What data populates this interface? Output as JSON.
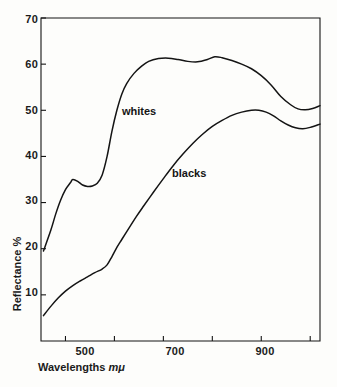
{
  "chart_data": {
    "type": "line",
    "title": "",
    "xlabel": "Wavelengths mμ",
    "xlabel_text": "Wavelengths",
    "xlabel_unit": "mμ",
    "ylabel": "Reflectance %",
    "xlim": [
      450,
      1020
    ],
    "ylim": [
      0,
      70
    ],
    "grid": false,
    "legend_position": "inline-annotations",
    "x_ticks_major": [
      500,
      700,
      900
    ],
    "x_tick_labels": [
      "500",
      "700",
      "900"
    ],
    "x_ticks_minor": [
      600,
      800,
      1000
    ],
    "y_ticks": [
      10,
      20,
      30,
      40,
      50,
      60,
      70
    ],
    "y_tick_labels": [
      "10",
      "20",
      "30",
      "40",
      "50",
      "60",
      "70"
    ],
    "line_color": "#141414",
    "background_color": "#fdfdfb",
    "series": [
      {
        "name": "whites",
        "label": "whites",
        "x": [
          455,
          470,
          480,
          490,
          500,
          510,
          515,
          525,
          535,
          545,
          555,
          565,
          575,
          585,
          595,
          605,
          615,
          625,
          640,
          655,
          670,
          690,
          710,
          730,
          750,
          770,
          790,
          805,
          820,
          840,
          860,
          880,
          900,
          920,
          940,
          960,
          975,
          990,
          1005,
          1020
        ],
        "y": [
          19.5,
          24.0,
          27.5,
          30.5,
          32.8,
          34.3,
          35.0,
          34.6,
          33.8,
          33.5,
          33.6,
          34.2,
          36.0,
          40.0,
          45.5,
          50.0,
          53.5,
          55.8,
          58.0,
          59.5,
          60.6,
          61.2,
          61.3,
          61.0,
          60.6,
          60.5,
          61.0,
          61.6,
          61.4,
          60.8,
          60.0,
          59.0,
          57.5,
          55.5,
          53.0,
          51.2,
          50.3,
          50.1,
          50.4,
          51.0
        ]
      },
      {
        "name": "blacks",
        "label": "blacks",
        "x": [
          455,
          470,
          485,
          500,
          515,
          530,
          545,
          560,
          575,
          585,
          595,
          605,
          615,
          630,
          645,
          660,
          680,
          700,
          720,
          740,
          760,
          780,
          800,
          820,
          840,
          860,
          880,
          895,
          910,
          925,
          940,
          955,
          970,
          985,
          1000,
          1020
        ],
        "y": [
          5.5,
          7.5,
          9.3,
          10.8,
          12.0,
          13.0,
          13.9,
          14.8,
          15.6,
          16.5,
          18.3,
          20.3,
          22.0,
          24.5,
          27.0,
          29.3,
          32.3,
          35.2,
          38.0,
          40.5,
          42.8,
          44.8,
          46.5,
          47.8,
          48.9,
          49.6,
          50.0,
          50.0,
          49.6,
          48.8,
          47.7,
          46.8,
          46.2,
          46.0,
          46.3,
          47.0
        ]
      }
    ],
    "annotations": [
      {
        "text": "whites",
        "x": 600,
        "y": 45
      },
      {
        "text": "blacks",
        "x": 700,
        "y": 37
      }
    ]
  }
}
